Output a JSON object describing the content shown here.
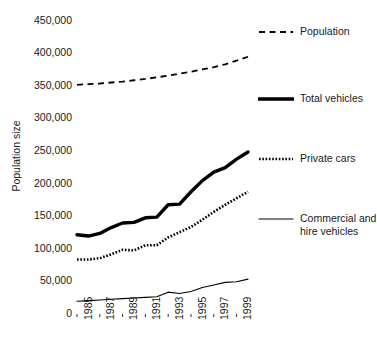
{
  "chart_data": {
    "type": "line",
    "title": "",
    "subtitle": "",
    "xlabel": "",
    "ylabel": "Population size",
    "xlim": [
      1985,
      2000
    ],
    "ylim": [
      0,
      450000
    ],
    "grid": false,
    "legend_position": "right",
    "y_ticks": [
      "0",
      "50,000",
      "100,000",
      "150,000",
      "200,000",
      "250,000",
      "300,000",
      "350,000",
      "400,000",
      "450,000"
    ],
    "y_tick_values": [
      0,
      50000,
      100000,
      150000,
      200000,
      250000,
      300000,
      350000,
      400000,
      450000
    ],
    "x_ticks": [
      "1985",
      "1987",
      "1989",
      "1991",
      "1993",
      "1995",
      "1997",
      "1999"
    ],
    "x_tick_values": [
      1985,
      1987,
      1989,
      1991,
      1993,
      1995,
      1997,
      1999
    ],
    "x": [
      1985,
      1986,
      1987,
      1988,
      1989,
      1990,
      1991,
      1992,
      1993,
      1994,
      1995,
      1996,
      1997,
      1998,
      1999,
      2000
    ],
    "series": [
      {
        "name": "Population",
        "style": "dashed",
        "width": 1.8,
        "color": "#000000",
        "values": [
          350000,
          351000,
          352000,
          353500,
          355000,
          357000,
          359000,
          361500,
          364000,
          367000,
          370000,
          373500,
          377000,
          381500,
          387000,
          393000
        ]
      },
      {
        "name": "Total vehicles",
        "style": "solid-thick",
        "width": 3.4,
        "color": "#000000",
        "values": [
          120000,
          118000,
          122000,
          131000,
          138000,
          139000,
          146000,
          147000,
          166000,
          167000,
          186000,
          203000,
          216000,
          223000,
          236000,
          247000
        ]
      },
      {
        "name": "Private cars",
        "style": "dotted",
        "width": 2.6,
        "color": "#000000",
        "values": [
          82000,
          82000,
          84000,
          90000,
          97000,
          96000,
          104000,
          104000,
          116000,
          124000,
          132000,
          143000,
          155000,
          166000,
          176000,
          186000
        ]
      },
      {
        "name": "Commercial and hire vehicles",
        "style": "solid-thin",
        "width": 1.1,
        "color": "#000000",
        "values": [
          18000,
          19000,
          20000,
          21000,
          22000,
          23000,
          24000,
          25000,
          32000,
          30000,
          33000,
          39000,
          43000,
          47000,
          48000,
          52000
        ]
      }
    ]
  },
  "legend": {
    "entries": [
      {
        "label": "Population",
        "style": "dashed"
      },
      {
        "label": "Total vehicles",
        "style": "solid-thick"
      },
      {
        "label": "Private cars",
        "style": "dotted"
      },
      {
        "label": "Commercial and hire vehicles",
        "style": "solid-thin"
      }
    ]
  }
}
